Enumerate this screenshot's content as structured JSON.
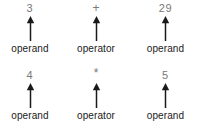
{
  "diagram": {
    "title_visible": false,
    "background_color": "#ffffff",
    "value_color": "#787878",
    "label_color": "#1a1a1a",
    "arrow_color": "#1a1a1a",
    "arrow_icon_name": "up-arrow-icon",
    "rows": [
      {
        "row_name": "expression-row-1",
        "tokens": [
          {
            "value": "3",
            "label": "operand",
            "role": "operand"
          },
          {
            "value": "+",
            "label": "operator",
            "role": "operator"
          },
          {
            "value": "29",
            "label": "operand",
            "role": "operand"
          }
        ]
      },
      {
        "row_name": "expression-row-2",
        "tokens": [
          {
            "value": "4",
            "label": "operand",
            "role": "operand"
          },
          {
            "value": "*",
            "label": "operator",
            "role": "operator"
          },
          {
            "value": "5",
            "label": "operand",
            "role": "operand"
          }
        ]
      }
    ]
  }
}
